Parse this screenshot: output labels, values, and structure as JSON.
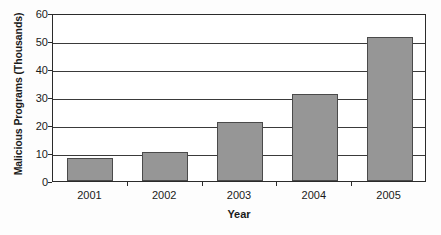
{
  "chart_data": {
    "type": "bar",
    "title": "",
    "subtitle": "",
    "xlabel": "Year",
    "ylabel": "Malicious Programs (Thousands)",
    "categories": [
      "2001",
      "2002",
      "2003",
      "2004",
      "2005"
    ],
    "values": [
      8.2,
      10.3,
      21.2,
      31.1,
      51.3
    ],
    "series": [
      {
        "name": "Malicious Programs",
        "values": [
          8.2,
          10.3,
          21.2,
          31.1,
          51.3
        ]
      }
    ],
    "ylim": [
      0,
      60
    ],
    "ytick_labels": [
      "0",
      "10",
      "20",
      "30",
      "40",
      "50",
      "60"
    ],
    "ytick_values": [
      0,
      10,
      20,
      30,
      40,
      50,
      60
    ],
    "ytick_interval": 10,
    "grid": "horizontal",
    "legend": "none",
    "annotations": [],
    "colors": {
      "bar_fill": "#969696",
      "bar_border": "#4a4a4a",
      "gridline": "#3a3a3a",
      "axis": "#2b2b2b",
      "plot_background": "#ffffff",
      "page_background": "#fdfdfd",
      "text": "#1a1a1a"
    }
  }
}
